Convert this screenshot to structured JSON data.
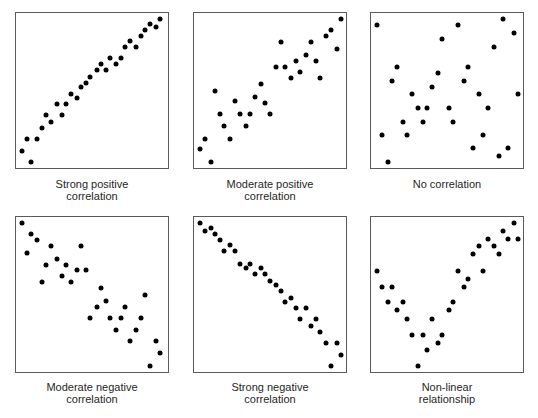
{
  "chart_data": [
    {
      "type": "scatter",
      "title": "Strong positive correlation",
      "xlabel": "",
      "ylabel": "",
      "xlim": [
        0,
        100
      ],
      "ylim": [
        0,
        100
      ],
      "grid": false,
      "legend": null,
      "x": [
        4,
        7,
        10,
        14,
        17,
        20,
        23,
        27,
        30,
        33,
        36,
        40,
        43,
        46,
        49,
        53,
        56,
        59,
        62,
        66,
        69,
        72,
        75,
        79,
        82,
        85,
        88,
        92,
        95
      ],
      "y": [
        11,
        19,
        4,
        19,
        26,
        34,
        30,
        41,
        34,
        41,
        48,
        45,
        52,
        55,
        59,
        63,
        67,
        63,
        71,
        67,
        71,
        78,
        82,
        78,
        85,
        89,
        93,
        91,
        96
      ]
    },
    {
      "type": "scatter",
      "title": "Moderate positive correlation",
      "xlabel": "",
      "ylabel": "",
      "xlim": [
        0,
        100
      ],
      "ylim": [
        0,
        100
      ],
      "grid": false,
      "legend": null,
      "x": [
        4,
        7,
        11,
        14,
        17,
        20,
        24,
        27,
        30,
        34,
        37,
        40,
        44,
        47,
        50,
        54,
        57,
        60,
        64,
        67,
        70,
        74,
        77,
        80,
        83,
        87,
        90,
        94,
        97
      ],
      "y": [
        12,
        19,
        4,
        50,
        35,
        27,
        19,
        43,
        35,
        27,
        35,
        46,
        54,
        42,
        35,
        65,
        81,
        65,
        58,
        69,
        62,
        73,
        81,
        69,
        58,
        85,
        89,
        77,
        96
      ]
    },
    {
      "type": "scatter",
      "title": "No correlation",
      "xlabel": "",
      "ylabel": "",
      "xlim": [
        0,
        100
      ],
      "ylim": [
        0,
        100
      ],
      "grid": false,
      "legend": null,
      "x": [
        4,
        7,
        11,
        14,
        17,
        21,
        24,
        27,
        31,
        34,
        37,
        40,
        44,
        47,
        51,
        54,
        57,
        61,
        64,
        67,
        71,
        74,
        77,
        81,
        84,
        87,
        90,
        94,
        97
      ],
      "y": [
        92,
        21,
        4,
        56,
        65,
        30,
        21,
        48,
        39,
        30,
        39,
        52,
        61,
        83,
        39,
        30,
        92,
        56,
        65,
        13,
        48,
        21,
        39,
        78,
        8,
        96,
        13,
        87,
        48
      ]
    },
    {
      "type": "scatter",
      "title": "Moderate negative correlation",
      "xlabel": "",
      "ylabel": "",
      "xlim": [
        0,
        100
      ],
      "ylim": [
        0,
        100
      ],
      "grid": false,
      "legend": null,
      "x": [
        4,
        7,
        10,
        14,
        17,
        20,
        23,
        27,
        30,
        33,
        36,
        40,
        43,
        46,
        49,
        53,
        56,
        59,
        62,
        66,
        69,
        72,
        75,
        79,
        82,
        85,
        88,
        92,
        95
      ],
      "y": [
        96,
        77,
        89,
        85,
        58,
        69,
        81,
        73,
        62,
        69,
        58,
        66,
        81,
        66,
        35,
        42,
        54,
        46,
        35,
        27,
        35,
        42,
        20,
        27,
        35,
        50,
        4,
        20,
        12
      ]
    },
    {
      "type": "scatter",
      "title": "Strong negative correlation",
      "xlabel": "",
      "ylabel": "",
      "xlim": [
        0,
        100
      ],
      "ylim": [
        0,
        100
      ],
      "grid": false,
      "legend": null,
      "x": [
        4,
        7,
        11,
        14,
        17,
        20,
        24,
        27,
        30,
        34,
        37,
        40,
        44,
        47,
        50,
        54,
        57,
        60,
        64,
        67,
        70,
        74,
        77,
        80,
        83,
        87,
        90,
        94,
        97
      ],
      "y": [
        96,
        91,
        93,
        89,
        85,
        78,
        82,
        78,
        70,
        67,
        70,
        63,
        67,
        63,
        59,
        56,
        52,
        45,
        48,
        41,
        34,
        41,
        30,
        34,
        26,
        19,
        4,
        19,
        11
      ]
    },
    {
      "type": "scatter",
      "title": "Non-linear relationship",
      "xlabel": "",
      "ylabel": "",
      "xlim": [
        0,
        100
      ],
      "ylim": [
        0,
        100
      ],
      "grid": false,
      "legend": null,
      "x": [
        4,
        7,
        11,
        14,
        17,
        21,
        24,
        27,
        31,
        34,
        37,
        40,
        44,
        47,
        51,
        54,
        57,
        61,
        64,
        67,
        71,
        74,
        77,
        81,
        84,
        87,
        90,
        94,
        97
      ],
      "y": [
        65,
        55,
        45,
        55,
        40,
        45,
        34,
        24,
        4,
        24,
        14,
        34,
        19,
        24,
        40,
        45,
        65,
        55,
        60,
        76,
        81,
        65,
        86,
        81,
        76,
        91,
        86,
        96,
        86
      ]
    }
  ],
  "panels": [
    {
      "caption_line1": "Strong positive",
      "caption_line2": "correlation"
    },
    {
      "caption_line1": "Moderate positive",
      "caption_line2": "correlation"
    },
    {
      "caption_line1": "No correlation",
      "caption_line2": ""
    },
    {
      "caption_line1": "Moderate negative",
      "caption_line2": "correlation"
    },
    {
      "caption_line1": "Strong negative",
      "caption_line2": "correlation"
    },
    {
      "caption_line1": "Non-linear",
      "caption_line2": "relationship"
    }
  ],
  "colors": {
    "dot": "#000000",
    "border": "#5a5a5a",
    "caption": "#262626"
  }
}
